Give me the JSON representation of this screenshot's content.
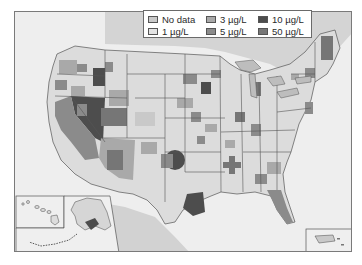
{
  "legend": {
    "items": [
      {
        "label": "No data",
        "color": "#c9c9c9"
      },
      {
        "label": "3 µg/L",
        "color": "#a9a9a9"
      },
      {
        "label": "10 µg/L",
        "color": "#4d4d4d"
      },
      {
        "label": "1 µg/L",
        "color": "#e3e3e3"
      },
      {
        "label": "5 µg/L",
        "color": "#8b8b8b"
      },
      {
        "label": "50 µg/L",
        "color": "#767676"
      }
    ]
  },
  "map": {
    "region": "United States",
    "insets": [
      "Hawaii",
      "Alaska",
      "Puerto Rico"
    ],
    "colors": {
      "ocean": "#efefef",
      "land_relief": "#d8d8d8",
      "border": "#555555",
      "frame": "#7a7a7a"
    }
  }
}
